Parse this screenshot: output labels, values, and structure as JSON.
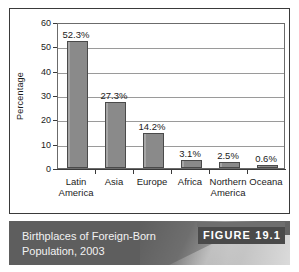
{
  "figure": {
    "caption_line1": "Birthplaces of Foreign-Born",
    "caption_line2": "Population, 2003",
    "badge_label": "FIGURE 19.1",
    "caption_bg": "#5e5e5e",
    "badge_bg": "#4a4a4a"
  },
  "chart_data": {
    "type": "bar",
    "title": "Birthplaces of Foreign-Born Population, 2003",
    "xlabel": "",
    "ylabel": "Percentage",
    "ylim": [
      0,
      60
    ],
    "yticks": [
      0,
      10,
      20,
      30,
      40,
      50,
      60
    ],
    "ytick_labels": [
      "0",
      "10",
      "20",
      "30",
      "40",
      "50",
      "60"
    ],
    "grid": true,
    "legend": false,
    "categories": [
      "Latin America",
      "Asia",
      "Europe",
      "Africa",
      "Northern America",
      "Oceana"
    ],
    "category_lines": [
      [
        "Latin",
        "America"
      ],
      [
        "Asia",
        ""
      ],
      [
        "Europe",
        ""
      ],
      [
        "Africa",
        ""
      ],
      [
        "Northern",
        "America"
      ],
      [
        "Oceana",
        ""
      ]
    ],
    "values": [
      52.3,
      27.3,
      14.2,
      3.1,
      2.5,
      0.6
    ],
    "data_labels": [
      "52.3%",
      "27.3%",
      "14.2%",
      "3.1%",
      "2.5%",
      "0.6%"
    ],
    "bar_color": "#8a8a8a",
    "bar_edge_color": "#4a4a4a"
  }
}
